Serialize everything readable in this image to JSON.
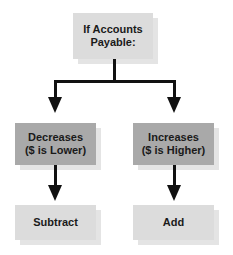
{
  "diagram": {
    "root": {
      "label": "If Accounts\nPayable:"
    },
    "branches": [
      {
        "condition": "Decreases\n($ is Lower)",
        "action": "Subtract"
      },
      {
        "condition": "Increases\n($ is Higher)",
        "action": "Add"
      }
    ]
  },
  "colors": {
    "light_box": "#dcdcdc",
    "dark_box": "#a9a9a9",
    "line": "#111111"
  }
}
